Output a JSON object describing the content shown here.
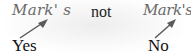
{
  "left": {
    "example": "Mark' s",
    "label": "Yes"
  },
  "middle": {
    "connector": "not"
  },
  "right": {
    "example": "Mark's",
    "label": "No"
  },
  "colors": {
    "example_text": "#6a6a6a",
    "label_text": "#111111",
    "arrow": "#5a5a5a"
  }
}
